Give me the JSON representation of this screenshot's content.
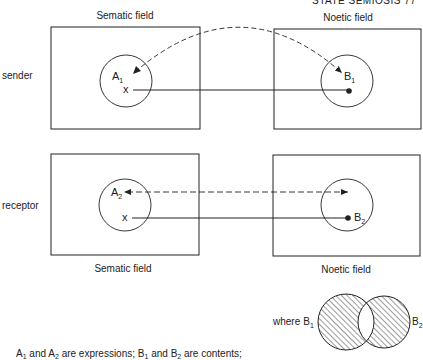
{
  "page_header": {
    "running_head_partial": "STATE SEMIOSIS   77"
  },
  "field_labels": {
    "top_left": "Sematic field",
    "top_right": "Noetic field",
    "bottom_left": "Sematic field",
    "bottom_right": "Noetic field"
  },
  "row_labels": {
    "sender": "sender",
    "receptor": "receptor"
  },
  "sender_row": {
    "expression": {
      "letter": "A",
      "subscript": "1"
    },
    "content": {
      "letter": "B",
      "subscript": "1"
    },
    "marker": "x"
  },
  "receptor_row": {
    "expression": {
      "letter": "A",
      "subscript": "2"
    },
    "content": {
      "letter": "B",
      "subscript": "2"
    },
    "marker": "x"
  },
  "venn": {
    "prefix": "where",
    "left": {
      "letter": "B",
      "subscript": "1"
    },
    "right": {
      "letter": "B",
      "subscript": "2"
    }
  },
  "caption": {
    "a1": "A",
    "a1_sub": "1",
    "and1": " and ",
    "a2": "A",
    "a2_sub": "2",
    "mid": " are expressions; ",
    "b1": "B",
    "b1_sub": "1",
    "and2": " and ",
    "b2": "B",
    "b2_sub": "2",
    "end": " are contents;"
  },
  "colors": {
    "ink": "#222222",
    "background": "#ffffff"
  }
}
